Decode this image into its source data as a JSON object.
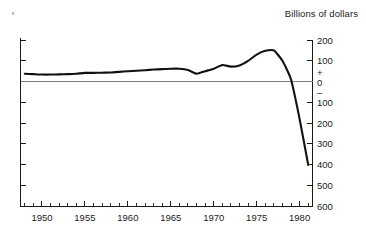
{
  "chart_data": {
    "type": "line",
    "title": "Billions of dollars",
    "subtitle": "",
    "xlabel": "",
    "ylabel": "Billions of dollars",
    "grid": false,
    "legend": "none",
    "xlim": [
      1947.5,
      1981.5
    ],
    "ylim": [
      -600,
      200
    ],
    "y_tick_labels": [
      "200",
      "100",
      "0",
      "100",
      "200",
      "300",
      "400",
      "500",
      "600"
    ],
    "y_tick_values": [
      200,
      100,
      0,
      -100,
      -200,
      -300,
      -400,
      -500,
      -600
    ],
    "y_sign_plus": "+",
    "y_sign_minus": "–",
    "y_zero_label": "0",
    "x_tick_labels": [
      "1950",
      "1955",
      "1960",
      "1965",
      "1970",
      "1975",
      "1980"
    ],
    "x_tick_values": [
      1950,
      1955,
      1960,
      1965,
      1970,
      1975,
      1980
    ],
    "x_minor_step": 1,
    "series": [
      {
        "name": "Balance",
        "color": "#111111",
        "x": [
          1948,
          1949,
          1950,
          1951,
          1952,
          1953,
          1954,
          1955,
          1956,
          1957,
          1958,
          1959,
          1960,
          1961,
          1962,
          1963,
          1964,
          1965,
          1966,
          1967,
          1968,
          1969,
          1970,
          1971,
          1972,
          1973,
          1974,
          1975,
          1976,
          1977,
          1978,
          1979,
          1980,
          1981
        ],
        "values": [
          38,
          36,
          34,
          34,
          35,
          36,
          38,
          42,
          42,
          43,
          44,
          47,
          50,
          52,
          55,
          58,
          60,
          62,
          62,
          56,
          38,
          50,
          62,
          80,
          72,
          78,
          100,
          130,
          148,
          150,
          100,
          10,
          -180,
          -400
        ]
      }
    ],
    "annotations": []
  },
  "figure": {
    "title_text": "Billions of dollars",
    "y_axis_side": "right",
    "background": "#ffffff",
    "line_color": "#111111",
    "axis_color": "#1a1a1a",
    "zero_line_color": "#6f6f6f"
  }
}
